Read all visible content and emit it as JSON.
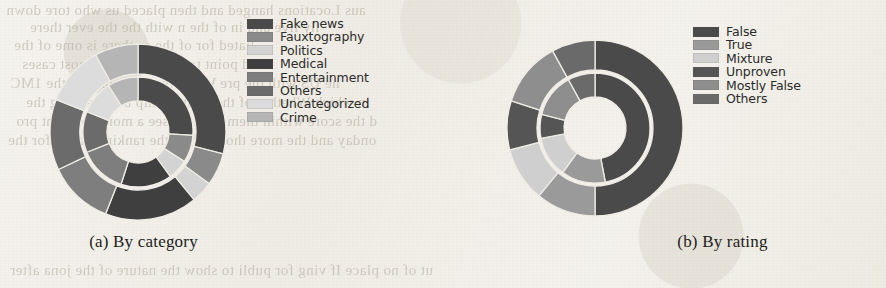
{
  "figure": {
    "panels": [
      {
        "id": "a",
        "caption": "(a) By category",
        "legend": [
          {
            "label": "Fake news",
            "color": "#4a4a4a"
          },
          {
            "label": "Fauxtography",
            "color": "#8a8a8a"
          },
          {
            "label": "Politics",
            "color": "#d3d3d3"
          },
          {
            "label": "Medical",
            "color": "#3f3f3f"
          },
          {
            "label": "Entertainment",
            "color": "#7e7e7e"
          },
          {
            "label": "Others",
            "color": "#6b6b6b"
          },
          {
            "label": "Uncategorized",
            "color": "#dcdcdc"
          },
          {
            "label": "Crime",
            "color": "#b5b5b5"
          }
        ]
      },
      {
        "id": "b",
        "caption": "(b) By rating",
        "legend": [
          {
            "label": "False",
            "color": "#4a4a4a"
          },
          {
            "label": "True",
            "color": "#9a9a9a"
          },
          {
            "label": "Mixture",
            "color": "#cfcfcf"
          },
          {
            "label": "Unproven",
            "color": "#555555"
          },
          {
            "label": "Mostly False",
            "color": "#8e8e8e"
          },
          {
            "label": "Others",
            "color": "#6a6a6a"
          }
        ]
      }
    ]
  },
  "chart_data": [
    {
      "type": "pie",
      "id": "by-category",
      "title": "(a) By category",
      "variant": "nested-donut",
      "legend_position": "right",
      "labels": [
        "Fake news",
        "Fauxtography",
        "Politics",
        "Medical",
        "Entertainment",
        "Others",
        "Uncategorized",
        "Crime"
      ],
      "colors": [
        "#4a4a4a",
        "#8a8a8a",
        "#d3d3d3",
        "#3f3f3f",
        "#7e7e7e",
        "#6b6b6b",
        "#dcdcdc",
        "#b5b5b5"
      ],
      "rings": [
        {
          "name": "outer",
          "values": [
            29.0,
            6.0,
            4.0,
            17.0,
            12.0,
            13.0,
            11.0,
            8.0
          ],
          "labels": [
            "Fake news",
            "Fauxtography",
            "Politics",
            "Medical",
            "Entertainment",
            "Others",
            "Uncategorized",
            "Crime"
          ]
        },
        {
          "name": "inner",
          "values": [
            26.0,
            8.0,
            6.0,
            15.0,
            14.0,
            12.0,
            10.0,
            9.0
          ],
          "labels": [
            "Fake news",
            "Fauxtography",
            "Politics",
            "Medical",
            "Entertainment",
            "Others",
            "Uncategorized",
            "Crime"
          ]
        }
      ]
    },
    {
      "type": "pie",
      "id": "by-rating",
      "title": "(b) By rating",
      "variant": "nested-donut",
      "legend_position": "right",
      "labels": [
        "False",
        "True",
        "Mixture",
        "Unproven",
        "Mostly False",
        "Others"
      ],
      "colors": [
        "#4a4a4a",
        "#9a9a9a",
        "#cfcfcf",
        "#555555",
        "#8e8e8e",
        "#6a6a6a"
      ],
      "rings": [
        {
          "name": "outer",
          "values": [
            50.0,
            11.0,
            10.0,
            9.0,
            12.0,
            8.0
          ],
          "labels": [
            "False",
            "True",
            "Mixture",
            "Unproven",
            "Mostly False",
            "Others"
          ]
        },
        {
          "name": "inner",
          "values": [
            47.0,
            13.0,
            12.0,
            7.0,
            13.0,
            8.0
          ],
          "labels": [
            "False",
            "True",
            "Mixture",
            "Unproven",
            "Mostly False",
            "Others"
          ]
        }
      ]
    }
  ],
  "background_text": {
    "note": "faint mirrored bleed-through from reverse page side; not primary content",
    "lines": [
      "aus Locations hanged and then placed us who tore down",
      "lly live and in of the n with the the ever there",
      "liated for of the as there is ome of the",
      "ed point to be or to the in most cases",
      "he US with the pre While the same orig of the 1MC",
      "in which Whether of the relationship between larg the",
      "d the score within them twee To see a more coherent pro",
      "onday and the more those while the ranking hange for the",
      "ut of no place If ving for publi to show the nature of the jona after"
    ]
  }
}
